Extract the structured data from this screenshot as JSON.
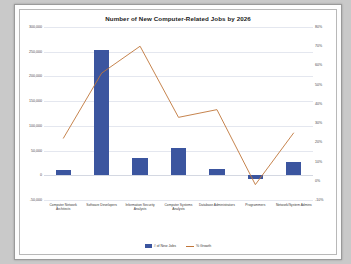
{
  "chart_data": {
    "type": "bar",
    "title": "Number of New Computer-Related Jobs by 2026",
    "xlabel": "",
    "ylabel": "",
    "categories": [
      "Computer Network Architects",
      "Software Developers",
      "Information Security Analysts",
      "Computer Systems Analysts",
      "Database Administrators",
      "Programmers",
      "Network/System Admins"
    ],
    "series": [
      {
        "name": "# of New Jobs",
        "type": "bar",
        "axis": "left",
        "color": "#3b559f",
        "values": [
          11000,
          253000,
          34000,
          55000,
          13000,
          -7000,
          27000
        ]
      },
      {
        "name": "% Growth",
        "type": "line",
        "axis": "right",
        "color": "#c0763a",
        "values": [
          22,
          56,
          70,
          33,
          37,
          -2,
          25
        ]
      }
    ],
    "ylim": [
      -50000,
      300000
    ],
    "yticks": [
      300000,
      250000,
      200000,
      150000,
      100000,
      50000,
      0,
      -50000
    ],
    "ytick_labels": [
      "300,000",
      "250,000",
      "200,000",
      "150,000",
      "100,000",
      "50,000",
      "0",
      "-50,000"
    ],
    "y2lim": [
      -10,
      80
    ],
    "y2ticks": [
      80,
      70,
      60,
      50,
      40,
      30,
      20,
      10,
      0,
      -10
    ],
    "y2tick_labels": [
      "80%",
      "70%",
      "60%",
      "50%",
      "40%",
      "30%",
      "20%",
      "10%",
      "0%",
      "-10%"
    ],
    "grid": true,
    "legend_position": "bottom",
    "legend": [
      "# of New Jobs",
      "% Growth"
    ]
  }
}
